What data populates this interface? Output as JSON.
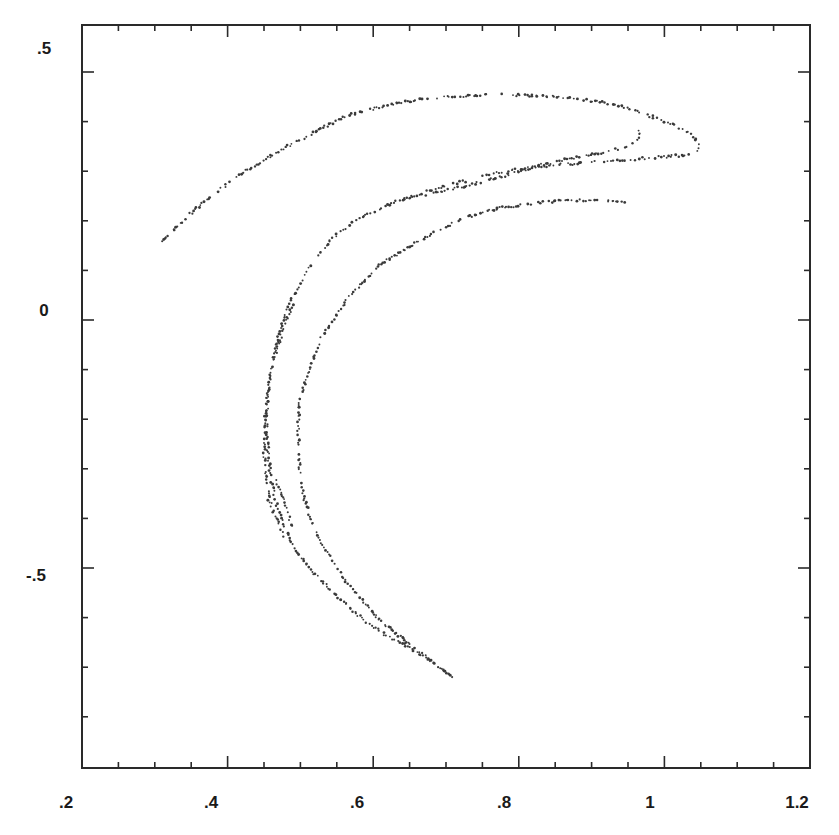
{
  "chart_data": {
    "type": "scatter",
    "title": "",
    "xlabel": "",
    "ylabel": "",
    "xlim": [
      0.2,
      1.2
    ],
    "ylim": [
      -0.9,
      0.6
    ],
    "grid": false,
    "legend": null,
    "x_ticks": [
      ".2",
      ".4",
      ".6",
      ".8",
      "1",
      "1.2"
    ],
    "x_tick_values": [
      0.2,
      0.4,
      0.6,
      0.8,
      1.0,
      1.2
    ],
    "y_ticks": [
      ".5",
      "0",
      "-.5"
    ],
    "y_tick_values": [
      0.5,
      0.0,
      -0.5
    ],
    "x_minor_step": 0.05,
    "y_minor_step": 0.1,
    "point_color": "#3a3a3a",
    "series": [
      {
        "name": "outer-top-arc",
        "points": [
          [
            0.31,
            0.157
          ],
          [
            0.336,
            0.195
          ],
          [
            0.362,
            0.232
          ],
          [
            0.396,
            0.27
          ],
          [
            0.431,
            0.306
          ],
          [
            0.465,
            0.336
          ],
          [
            0.499,
            0.363
          ],
          [
            0.534,
            0.39
          ],
          [
            0.568,
            0.413
          ],
          [
            0.603,
            0.427
          ],
          [
            0.637,
            0.438
          ],
          [
            0.671,
            0.445
          ],
          [
            0.705,
            0.45
          ],
          [
            0.74,
            0.453
          ],
          [
            0.774,
            0.454
          ],
          [
            0.808,
            0.453
          ],
          [
            0.843,
            0.45
          ],
          [
            0.877,
            0.446
          ],
          [
            0.911,
            0.44
          ],
          [
            0.94,
            0.43
          ],
          [
            0.966,
            0.419
          ],
          [
            0.994,
            0.404
          ],
          [
            1.021,
            0.387
          ],
          [
            1.035,
            0.376
          ],
          [
            1.042,
            0.367
          ],
          [
            1.046,
            0.355
          ],
          [
            1.046,
            0.343
          ],
          [
            1.042,
            0.333
          ]
        ]
      },
      {
        "name": "inner-upper-arc",
        "points": [
          [
            1.035,
            0.333
          ],
          [
            1.008,
            0.33
          ],
          [
            0.98,
            0.327
          ],
          [
            0.946,
            0.323
          ],
          [
            0.911,
            0.319
          ],
          [
            0.877,
            0.315
          ],
          [
            0.843,
            0.312
          ],
          [
            0.808,
            0.306
          ],
          [
            0.774,
            0.298
          ],
          [
            0.74,
            0.286
          ],
          [
            0.705,
            0.272
          ],
          [
            0.671,
            0.258
          ],
          [
            0.637,
            0.242
          ],
          [
            0.609,
            0.224
          ],
          [
            0.582,
            0.206
          ],
          [
            0.561,
            0.185
          ],
          [
            0.541,
            0.161
          ]
        ]
      },
      {
        "name": "notch-arc",
        "points": [
          [
            0.966,
            0.383
          ],
          [
            0.965,
            0.373
          ],
          [
            0.963,
            0.363
          ],
          [
            0.955,
            0.355
          ],
          [
            0.946,
            0.347
          ],
          [
            0.922,
            0.34
          ],
          [
            0.898,
            0.333
          ],
          [
            0.863,
            0.323
          ],
          [
            0.829,
            0.312
          ],
          [
            0.795,
            0.298
          ],
          [
            0.76,
            0.282
          ],
          [
            0.726,
            0.27
          ],
          [
            0.692,
            0.258
          ],
          [
            0.664,
            0.25
          ],
          [
            0.637,
            0.242
          ]
        ]
      },
      {
        "name": "innermost-arc",
        "points": [
          [
            0.946,
            0.238
          ],
          [
            0.915,
            0.24
          ],
          [
            0.884,
            0.242
          ],
          [
            0.86,
            0.24
          ],
          [
            0.836,
            0.238
          ],
          [
            0.805,
            0.232
          ],
          [
            0.774,
            0.226
          ],
          [
            0.746,
            0.214
          ],
          [
            0.719,
            0.202
          ],
          [
            0.691,
            0.182
          ],
          [
            0.664,
            0.161
          ],
          [
            0.636,
            0.136
          ],
          [
            0.609,
            0.111
          ],
          [
            0.588,
            0.08
          ],
          [
            0.568,
            0.05
          ],
          [
            0.547,
            0.005
          ],
          [
            0.527,
            -0.04
          ],
          [
            0.512,
            -0.1
          ],
          [
            0.499,
            -0.161
          ],
          [
            0.497,
            -0.212
          ],
          [
            0.497,
            -0.262
          ],
          [
            0.5,
            -0.313
          ],
          [
            0.506,
            -0.363
          ],
          [
            0.515,
            -0.404
          ],
          [
            0.527,
            -0.444
          ],
          [
            0.543,
            -0.484
          ],
          [
            0.561,
            -0.524
          ],
          [
            0.585,
            -0.565
          ],
          [
            0.609,
            -0.605
          ],
          [
            0.63,
            -0.63
          ],
          [
            0.651,
            -0.655
          ],
          [
            0.678,
            -0.686
          ],
          [
            0.705,
            -0.716
          ],
          [
            0.712,
            -0.722
          ]
        ]
      },
      {
        "name": "middle-left-arc",
        "points": [
          [
            0.541,
            0.161
          ],
          [
            0.527,
            0.136
          ],
          [
            0.513,
            0.111
          ],
          [
            0.5,
            0.075
          ],
          [
            0.486,
            0.04
          ],
          [
            0.475,
            -0.01
          ],
          [
            0.465,
            -0.06
          ],
          [
            0.459,
            -0.11
          ],
          [
            0.455,
            -0.161
          ],
          [
            0.454,
            -0.212
          ],
          [
            0.455,
            -0.262
          ],
          [
            0.459,
            -0.313
          ],
          [
            0.465,
            -0.363
          ],
          [
            0.477,
            -0.414
          ],
          [
            0.493,
            -0.464
          ],
          [
            0.515,
            -0.504
          ],
          [
            0.541,
            -0.544
          ],
          [
            0.568,
            -0.58
          ],
          [
            0.596,
            -0.615
          ],
          [
            0.623,
            -0.64
          ],
          [
            0.651,
            -0.66
          ],
          [
            0.678,
            -0.69
          ],
          [
            0.705,
            -0.716
          ]
        ]
      },
      {
        "name": "far-left-arc",
        "points": [
          [
            0.489,
            0.03
          ],
          [
            0.478,
            -0.01
          ],
          [
            0.468,
            -0.06
          ],
          [
            0.46,
            -0.11
          ],
          [
            0.454,
            -0.161
          ],
          [
            0.451,
            -0.212
          ],
          [
            0.45,
            -0.262
          ],
          [
            0.452,
            -0.313
          ],
          [
            0.457,
            -0.363
          ],
          [
            0.462,
            -0.383
          ],
          [
            0.468,
            -0.404
          ],
          [
            0.474,
            -0.424
          ],
          [
            0.479,
            -0.444
          ]
        ]
      },
      {
        "name": "lower-fragment",
        "points": [
          [
            0.467,
            -0.323
          ],
          [
            0.472,
            -0.343
          ],
          [
            0.476,
            -0.363
          ],
          [
            0.481,
            -0.383
          ],
          [
            0.486,
            -0.404
          ],
          [
            0.488,
            -0.424
          ]
        ]
      }
    ]
  }
}
